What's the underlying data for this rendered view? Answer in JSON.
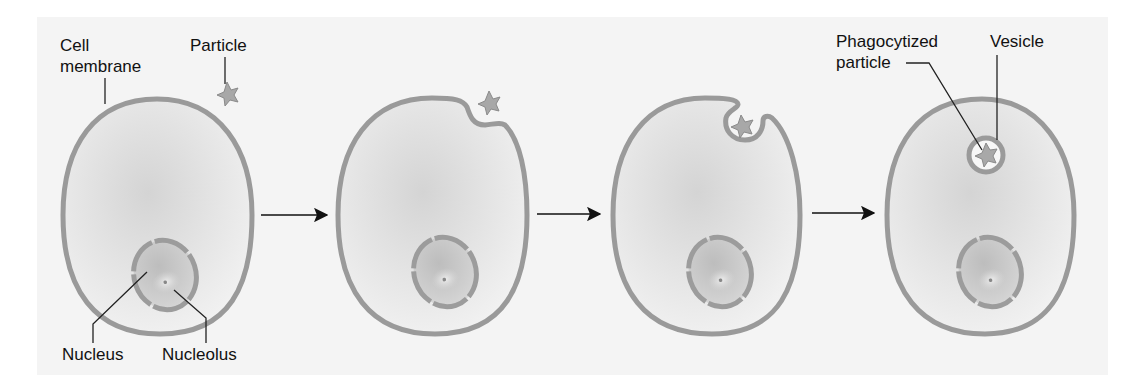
{
  "diagram": {
    "type": "process-sequence",
    "stages": [
      {
        "id": "stage-1",
        "description": "Particle approaches cell"
      },
      {
        "id": "stage-2",
        "description": "Membrane invaginates at particle"
      },
      {
        "id": "stage-3",
        "description": "Membrane surrounds particle"
      },
      {
        "id": "stage-4",
        "description": "Particle enclosed in vesicle"
      }
    ],
    "labels": {
      "cell_membrane_line1": "Cell",
      "cell_membrane_line2": "membrane",
      "particle": "Particle",
      "nucleus": "Nucleus",
      "nucleolus": "Nucleolus",
      "phagocytized_line1": "Phagocytized",
      "phagocytized_line2": "particle",
      "vesicle": "Vesicle"
    },
    "colors": {
      "panel_background": "#f3f3f3",
      "membrane": "#9a9a9a",
      "cytoplasm": "#d9d9d9",
      "nucleus_fill": "#c8c8c8",
      "leader_lines": "#222222",
      "arrows": "#111111"
    }
  }
}
